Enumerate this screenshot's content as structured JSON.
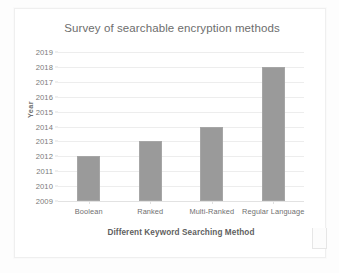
{
  "chart_data": {
    "type": "bar",
    "title": "Survey of searchable encryption methods",
    "xlabel": "Different Keyword Searching Method",
    "ylabel": "Year",
    "categories": [
      "Boolean",
      "Ranked",
      "Multi-Ranked",
      "Regular Language"
    ],
    "values": [
      2012,
      2013,
      2014,
      2018
    ],
    "ylim": [
      2009,
      2019
    ],
    "ytick_labels": [
      "2019",
      "2018",
      "2017",
      "2016",
      "2015",
      "2014",
      "2013",
      "2012",
      "2011",
      "2010",
      "2009"
    ],
    "ytick_values": [
      2019,
      2018,
      2017,
      2016,
      2015,
      2014,
      2013,
      2012,
      2011,
      2010,
      2009
    ],
    "grid": true,
    "legend": false,
    "bar_color": "#9a9a9a",
    "gridline_color": "#ededed",
    "title_color": "#6d6d6d",
    "series": [
      {
        "name": "Year",
        "values": [
          2012,
          2013,
          2014,
          2018
        ]
      }
    ]
  }
}
